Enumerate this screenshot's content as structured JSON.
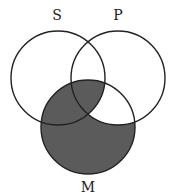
{
  "diagram": {
    "type": "venn",
    "sets": [
      {
        "id": "S",
        "label": "S",
        "cx": 58,
        "cy": 78,
        "r": 47,
        "label_x": 57,
        "label_y": 20
      },
      {
        "id": "P",
        "label": "P",
        "cx": 118,
        "cy": 78,
        "r": 47,
        "label_x": 118,
        "label_y": 20
      },
      {
        "id": "M",
        "label": "M",
        "cx": 88,
        "cy": 127,
        "r": 47,
        "label_x": 88,
        "label_y": 192
      }
    ],
    "shaded_region": "M minus (P not S)",
    "shaded_regions": [
      "S∩M∩¬P",
      "S∩P∩M",
      "M∩¬S∩¬P"
    ],
    "unshaded_in_M": [
      "P∩M∩¬S"
    ],
    "colors": {
      "stroke": "#222222",
      "shade": "#5b5b5b",
      "background": "#ffffff"
    }
  }
}
